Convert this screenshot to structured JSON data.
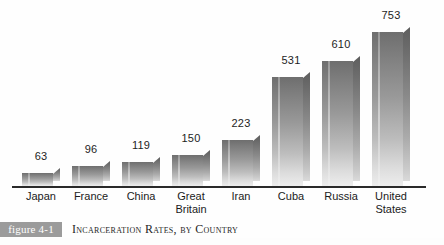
{
  "figure": {
    "badge_label": "figure 4-1",
    "caption": "Incarceration Rates, by Country"
  },
  "chart_data": {
    "type": "bar",
    "title": "Incarceration Rates, by Country",
    "xlabel": "",
    "ylabel": "",
    "ylim": [
      0,
      800
    ],
    "grid": false,
    "legend": "none",
    "value_labels_shown": true,
    "categories": [
      "Japan",
      "France",
      "China",
      "Great Britain",
      "Iran",
      "Cuba",
      "Russia",
      "United States"
    ],
    "values": [
      63,
      96,
      119,
      150,
      223,
      531,
      610,
      753
    ],
    "points": [
      {
        "category": "Japan",
        "lines": [
          "Japan"
        ],
        "value": 63
      },
      {
        "category": "France",
        "lines": [
          "France"
        ],
        "value": 96
      },
      {
        "category": "China",
        "lines": [
          "China"
        ],
        "value": 119
      },
      {
        "category": "Great Britain",
        "lines": [
          "Great",
          "Britain"
        ],
        "value": 150
      },
      {
        "category": "Iran",
        "lines": [
          "Iran"
        ],
        "value": 223
      },
      {
        "category": "Cuba",
        "lines": [
          "Cuba"
        ],
        "value": 531
      },
      {
        "category": "Russia",
        "lines": [
          "Russia"
        ],
        "value": 610
      },
      {
        "category": "United States",
        "lines": [
          "United",
          "States"
        ],
        "value": 753
      }
    ]
  },
  "colors": {
    "bar_top": "#6e6e6e",
    "bar_bottom": "#ededed",
    "bar_side": "#8a8a8a",
    "axis": "#2a2a2a",
    "badge_background": "#9b9b9b",
    "badge_text": "#ffffff",
    "text": "#1b1b1b",
    "background": "#ffffff"
  }
}
